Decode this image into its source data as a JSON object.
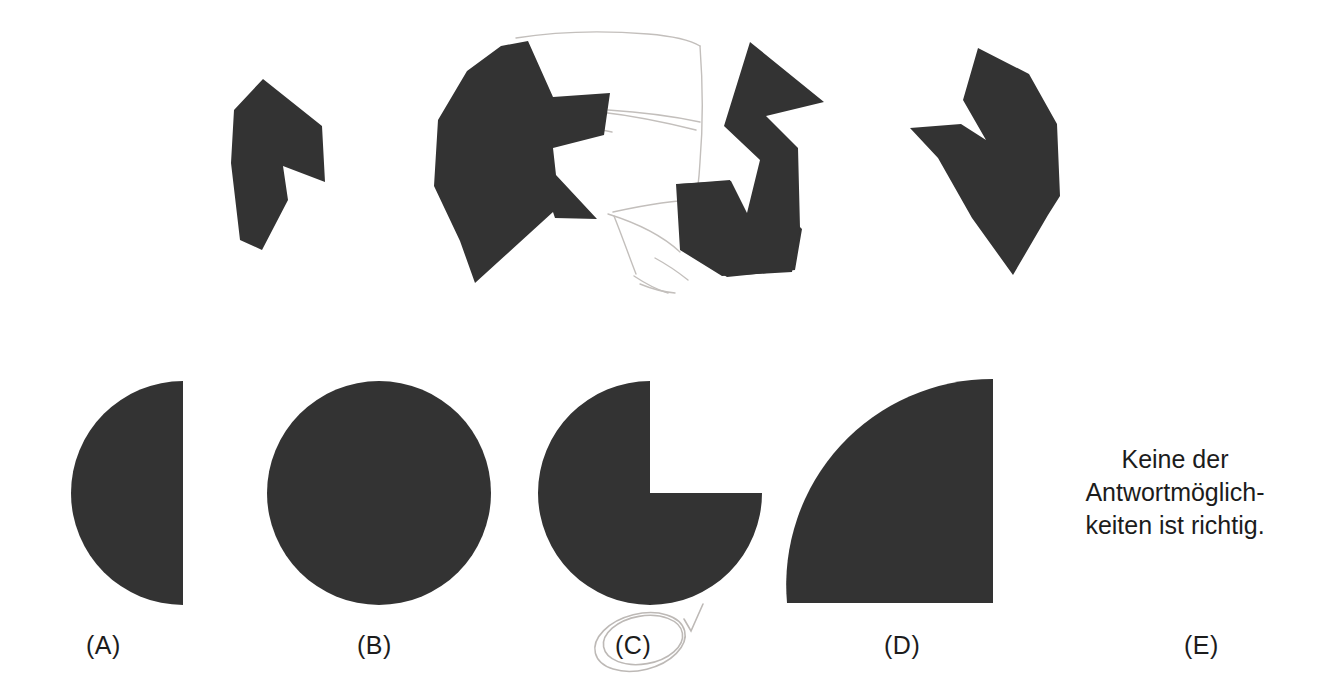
{
  "page": {
    "kind": "figure-assembly-test-item",
    "language": "de",
    "background_color": "#ffffff",
    "shape_fill_color": "#333333",
    "text_color": "#1c1c1c",
    "pencil_color": "#b9b5b2"
  },
  "fragments": {
    "caption": "",
    "count": 4,
    "items": [
      {
        "id": "fragment-1",
        "name": "fragment-piece-1"
      },
      {
        "id": "fragment-2",
        "name": "fragment-piece-2"
      },
      {
        "id": "fragment-3",
        "name": "fragment-piece-3"
      },
      {
        "id": "fragment-4",
        "name": "fragment-piece-4"
      }
    ]
  },
  "options": [
    {
      "key": "A",
      "label": "(A)",
      "shape": "half-circle-left",
      "selected": false
    },
    {
      "key": "B",
      "label": "(B)",
      "shape": "full-circle",
      "selected": false
    },
    {
      "key": "C",
      "label": "(C)",
      "shape": "circle-with-quarter-notch",
      "selected": true
    },
    {
      "key": "D",
      "label": "(D)",
      "shape": "quarter-circle",
      "selected": false
    },
    {
      "key": "E",
      "label": "(E)",
      "shape": "text-only",
      "selected": false
    }
  ],
  "none_option": {
    "line1": "Keine der",
    "line2": "Antwortmöglich-",
    "line3": "keiten ist richtig."
  },
  "annotations": {
    "selected_option_key": "C",
    "checkmark": "✓",
    "ellipse_around": "(C)"
  }
}
